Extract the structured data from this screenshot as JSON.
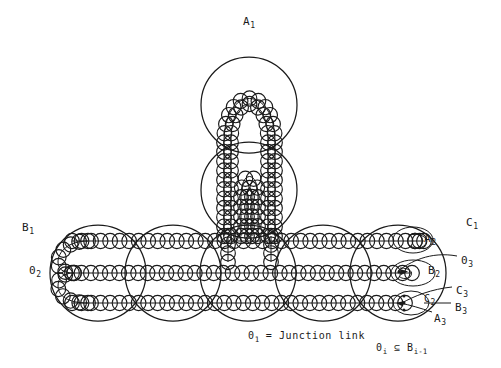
{
  "figure": {
    "background_color": "#ffffff",
    "ink_color": "#1a1a1a",
    "width": 501,
    "height": 368
  },
  "labels": {
    "a1": {
      "text": "A",
      "sub": "1",
      "x": 243,
      "y": 16
    },
    "b1": {
      "text": "B",
      "sub": "1",
      "x": 22,
      "y": 222
    },
    "o2": {
      "text": "0",
      "sub": "2",
      "x": 29,
      "y": 265
    },
    "c1": {
      "text": "C",
      "sub": "1",
      "x": 466,
      "y": 217
    },
    "a2": {
      "text": "A",
      "sub": "2",
      "x": 424,
      "y": 233
    },
    "o3": {
      "text": "0",
      "sub": "3",
      "x": 461,
      "y": 255
    },
    "b2": {
      "text": "B",
      "sub": "2",
      "x": 428,
      "y": 265
    },
    "c3": {
      "text": "C",
      "sub": "3",
      "x": 456,
      "y": 285
    },
    "c2": {
      "text": "C",
      "sub": "2",
      "x": 424,
      "y": 294
    },
    "b3": {
      "text": "B",
      "sub": "3",
      "x": 455,
      "y": 302
    },
    "a3": {
      "text": "A",
      "sub": "3",
      "x": 434,
      "y": 313
    }
  },
  "captions": {
    "junction": {
      "lead": "0",
      "lead_sub": "1",
      "rest": " = Junction link",
      "x": 248,
      "y": 331
    },
    "subset": {
      "lead": "0",
      "lead_sub": "i",
      "mid": " ⊆ B",
      "tail_sub": "i-1",
      "x": 376,
      "y": 343
    }
  },
  "structure": {
    "big_circles_row": [
      {
        "cx": 98,
        "cy": 273,
        "r": 48
      },
      {
        "cx": 173,
        "cy": 273,
        "r": 48
      },
      {
        "cx": 248,
        "cy": 273,
        "r": 48
      },
      {
        "cx": 323,
        "cy": 273,
        "r": 48
      },
      {
        "cx": 398,
        "cy": 273,
        "r": 48
      }
    ],
    "big_circles_arm": [
      {
        "cx": 249,
        "cy": 105,
        "r": 48
      },
      {
        "cx": 249,
        "cy": 190,
        "r": 48
      }
    ],
    "strand_count_horizontal": 3,
    "bead_radius": 7.2,
    "bead_spacing": 9.4,
    "notes": "Chain of overlapping small circles (beads) folded into hairpins; five large circles across bottom, two stacked circles forming vertical arm."
  }
}
